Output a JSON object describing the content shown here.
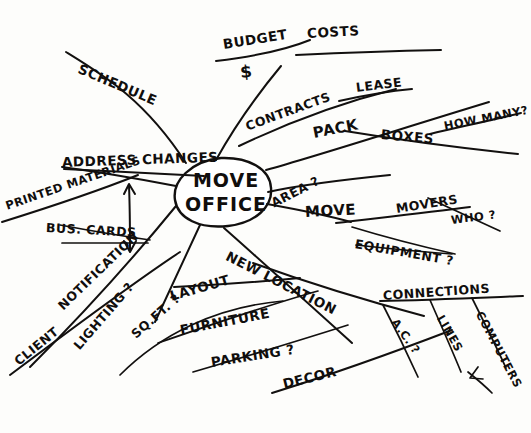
{
  "document": {
    "kind": "hand-drawn-mind-map",
    "center_topic": {
      "line1": "MOVE",
      "line2": "OFFICE"
    },
    "ink_color": "#12100f",
    "paper_color": "#fdfdfb"
  },
  "branches": [
    {
      "id": "budget",
      "label": "BUDGET"
    },
    {
      "id": "costs",
      "label": "COSTS"
    },
    {
      "id": "money-symbol",
      "label": "$"
    },
    {
      "id": "schedule",
      "label": "SCHEDULE"
    },
    {
      "id": "contracts",
      "label": "CONTRACTS"
    },
    {
      "id": "lease",
      "label": "LEASE"
    },
    {
      "id": "pack",
      "label": "PACK"
    },
    {
      "id": "boxes",
      "label": "BOXES"
    },
    {
      "id": "how-many",
      "label": "HOW MANY?"
    },
    {
      "id": "address-changes",
      "label": "ADDRESS CHANGES"
    },
    {
      "id": "printed-materials",
      "label": "PRINTED MATERIALS"
    },
    {
      "id": "bus-cards",
      "label": "BUS. CARDS"
    },
    {
      "id": "area",
      "label": "AREA ?"
    },
    {
      "id": "move",
      "label": "MOVE"
    },
    {
      "id": "movers",
      "label": "MOVERS"
    },
    {
      "id": "who",
      "label": "WHO ?"
    },
    {
      "id": "equipment",
      "label": "EQUIPMENT ?"
    },
    {
      "id": "notification",
      "label": "NOTIFICATION"
    },
    {
      "id": "client",
      "label": "CLIENT"
    },
    {
      "id": "lighting",
      "label": "LIGHTING ?"
    },
    {
      "id": "sqft",
      "label": "SQ.FT. ?"
    },
    {
      "id": "layout",
      "label": "LAYOUT"
    },
    {
      "id": "new-location",
      "label": "NEW LOCATION"
    },
    {
      "id": "furniture",
      "label": "FURNITURE"
    },
    {
      "id": "parking",
      "label": "PARKING ?"
    },
    {
      "id": "decor",
      "label": "DECOR"
    },
    {
      "id": "connections",
      "label": "CONNECTIONS"
    },
    {
      "id": "ac",
      "label": "A.C. ?"
    },
    {
      "id": "lines",
      "label": "LINES"
    },
    {
      "id": "computers",
      "label": "COMPUTERS"
    }
  ]
}
